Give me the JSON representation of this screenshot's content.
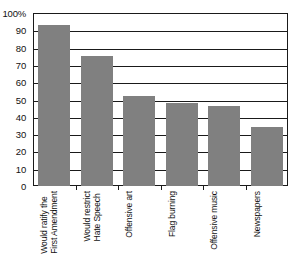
{
  "chart_data": {
    "type": "bar",
    "title": "",
    "subtitle": "",
    "xlabel": "",
    "ylabel": "",
    "ylim": [
      0,
      100
    ],
    "grid": true,
    "legend": null,
    "bar_color": "#808080",
    "axis_color": "#1a1a1a",
    "background": "#ffffff",
    "categories": [
      "Would ratify the First Amendment",
      "Would restrict Hate Speech",
      "Offensive art",
      "Flag burning",
      "Offensive music",
      "Newspapers"
    ],
    "category_lines": [
      [
        "Would ratify the",
        "First Amendment"
      ],
      [
        "Would restrict",
        "Hate Speech"
      ],
      [
        "Offensive art",
        ""
      ],
      [
        "Flag burning",
        ""
      ],
      [
        "Offensive music",
        ""
      ],
      [
        "Newspapers",
        ""
      ]
    ],
    "values": [
      93,
      75,
      52,
      48,
      46,
      34
    ],
    "ytick_values": [
      0,
      10,
      20,
      30,
      40,
      50,
      60,
      70,
      80,
      90,
      100
    ],
    "ytick_labels": [
      "0",
      "10",
      "20",
      "30",
      "40",
      "50",
      "60",
      "70",
      "80",
      "90",
      "100%"
    ]
  }
}
